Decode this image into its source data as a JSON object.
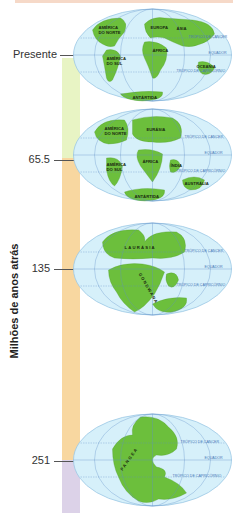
{
  "axis": {
    "title": "Milhões de anos atrás"
  },
  "timeline": {
    "ticks": [
      {
        "label": "Presente"
      },
      {
        "label": "65.5"
      },
      {
        "label": "135"
      },
      {
        "label": "251"
      }
    ],
    "colors": {
      "recent": "#e8f4c4",
      "middle": "#f8d7a0",
      "oldest": "#dcd2e8"
    }
  },
  "geo_lines": {
    "cancer": "TRÓPICO DE CÂNCER",
    "equator": "EQUADOR",
    "capricorn": "TRÓPICO DE CAPRICÓRNIO"
  },
  "maps": [
    {
      "era": "Presente",
      "labels": [
        "AMÉRICA",
        "DO NORTE",
        "EUROPA",
        "ÁSIA",
        "ÁFRICA",
        "AMÉRICA",
        "DO SUL",
        "OCEANIA",
        "ANTÁRTIDA"
      ]
    },
    {
      "era": "65.5",
      "labels": [
        "AMÉRICA",
        "DO NORTE",
        "EURÁSIA",
        "ÁFRICA",
        "AMÉRICA",
        "DO SUL",
        "ÍNDIA",
        "AUSTRÁLIA",
        "ANTÁRTIDA"
      ]
    },
    {
      "era": "135",
      "labels": [
        "LAURÁSIA",
        "GONDWANA"
      ]
    },
    {
      "era": "251",
      "labels": [
        "PANGEA"
      ]
    }
  ],
  "colors": {
    "ocean": "#d6f0fa",
    "land": "#6cbf3c",
    "grid": "#5f8fc9",
    "border": "#9cc8e4"
  }
}
